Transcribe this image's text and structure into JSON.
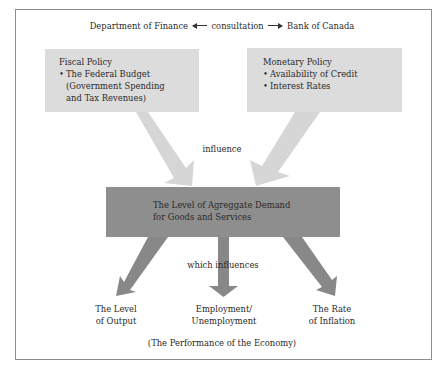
{
  "header": {
    "left_entity": "Department of Finance",
    "relation": "consultation",
    "right_entity": "Bank of Canada"
  },
  "fiscal_box": {
    "title": "Fiscal Policy",
    "bullets": [
      {
        "line1": "The Federal Budget",
        "line2": "(Government Spending",
        "line3": "and Tax Revenues)"
      }
    ]
  },
  "monetary_box": {
    "title": "Monetary Policy",
    "bullets": [
      "Availability of Credit",
      "Interest Rates"
    ]
  },
  "influence_label": "influence",
  "demand_box": {
    "line1": "The Level of Agreggate Demand",
    "line2": "for Goods and Services"
  },
  "which_influences_label": "which influences",
  "outcomes": [
    {
      "line1": "The Level",
      "line2": "of Output"
    },
    {
      "line1": "Employment/",
      "line2": "Unemployment"
    },
    {
      "line1": "The Rate",
      "line2": "of Inflation"
    }
  ],
  "footer": "(The Performance of the Economy)",
  "colors": {
    "light_box": "#dcdcdc",
    "light_arrow": "#d6d6d6",
    "dark_box": "#8e8e8e",
    "dark_arrow": "#888888",
    "frame": "#8c8c8c"
  }
}
